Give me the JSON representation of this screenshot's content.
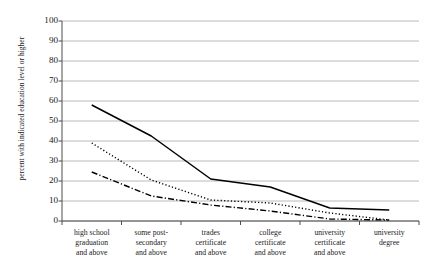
{
  "chart_data": {
    "type": "line",
    "title": "",
    "xlabel": "",
    "ylabel": "percent with indicated education level or higher",
    "ylim": [
      0,
      100
    ],
    "yticks": [
      0,
      10,
      20,
      30,
      40,
      50,
      60,
      70,
      80,
      90,
      100
    ],
    "grid": "horizontal",
    "legend": "none",
    "categories": [
      "high school graduation and above",
      "some post-secondary and above",
      "trades certificate and above",
      "college certificate and above",
      "university certificate and above",
      "university degree"
    ],
    "category_lines": [
      [
        "high school",
        "graduation",
        "and above"
      ],
      [
        "some post-",
        "secondary",
        "and above"
      ],
      [
        "trades",
        "certificate",
        "and above"
      ],
      [
        "college",
        "certificate",
        "and above"
      ],
      [
        "university",
        "certificate",
        "and above"
      ],
      [
        "university",
        "degree"
      ]
    ],
    "series": [
      {
        "name": "series-solid",
        "style": "solid",
        "color": "#000000",
        "values": [
          58,
          42.5,
          21,
          17,
          6.5,
          5.5
        ]
      },
      {
        "name": "series-dotted",
        "style": "dotted",
        "color": "#000000",
        "values": [
          39,
          20.5,
          10.5,
          9,
          4,
          0.5
        ]
      },
      {
        "name": "series-dash-dot",
        "style": "dash-dot",
        "color": "#000000",
        "values": [
          24.5,
          12.5,
          8,
          5,
          1,
          0.5
        ]
      }
    ]
  },
  "axis": {
    "y_tick_labels": [
      "100",
      "90",
      "80",
      "70",
      "60",
      "50",
      "40",
      "30",
      "20",
      "10",
      "0"
    ],
    "y_title": "percent with indicated education level or higher"
  },
  "colors": {
    "gridline": "#a8a8a8",
    "axis": "#4d4d4d",
    "line": "#000000",
    "background": "#ffffff"
  }
}
